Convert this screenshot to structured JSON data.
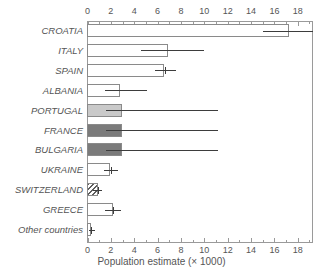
{
  "chart_data": {
    "type": "bar",
    "orientation": "horizontal",
    "title": "",
    "xlabel": "Population estimate (× 1000)",
    "ylabel": "",
    "xlim": [
      0,
      19.3
    ],
    "xticks": [
      0,
      2,
      4,
      6,
      8,
      10,
      12,
      14,
      16,
      18
    ],
    "xticklabels": [
      "0",
      "2",
      "4",
      "6",
      "8",
      "10",
      "12",
      "14",
      "16",
      "18"
    ],
    "minor_ticks": [
      1,
      3,
      5,
      7,
      9,
      11,
      13,
      15,
      17,
      19
    ],
    "grid": false,
    "legend": null,
    "axis_top_ticks": true,
    "axis_bottom_ticks": true,
    "categories": [
      "CROATIA",
      "ITALY",
      "SPAIN",
      "ALBANIA",
      "PORTUGAL",
      "FRANCE",
      "BULGARIA",
      "UKRAINE",
      "SWITZERLAND",
      "GREECE",
      "Other countries"
    ],
    "values": [
      17.3,
      6.9,
      6.6,
      2.8,
      3.0,
      3.0,
      3.0,
      2.0,
      0.9,
      2.2,
      0.3
    ],
    "error_low": [
      15.0,
      4.6,
      5.8,
      1.5,
      1.6,
      1.6,
      1.6,
      1.4,
      0.5,
      1.5,
      0.15
    ],
    "error_high": [
      19.3,
      10.0,
      7.6,
      5.1,
      11.2,
      11.2,
      11.2,
      2.6,
      1.2,
      2.9,
      0.6
    ],
    "fills": [
      "white",
      "white",
      "white",
      "white",
      "light-gray",
      "dark-gray",
      "dark-gray",
      "white",
      "hatched",
      "white",
      "white"
    ],
    "colors": {
      "bar_edge": "#8a8a8a",
      "bar_white": "#ffffff",
      "bar_light_gray": "#c9c9c9",
      "bar_dark_gray": "#7b7b7b",
      "hatch_line": "#5f5f5f",
      "error_bar": "#3d3d3d",
      "axis": "#9a9a9a",
      "text": "#555555",
      "background": "#ffffff"
    }
  }
}
